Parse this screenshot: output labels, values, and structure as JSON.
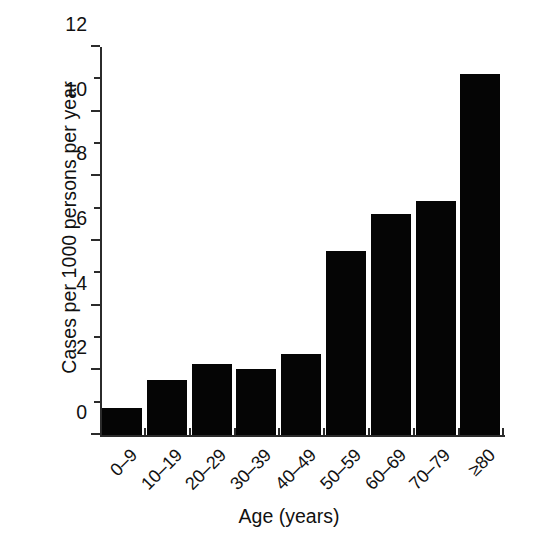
{
  "chart_data": {
    "type": "bar",
    "title": "",
    "xlabel": "Age (years)",
    "ylabel": "Cases per 1000 persons per year",
    "categories": [
      "0–9",
      "10–19",
      "20–29",
      "30–39",
      "40–49",
      "50–59",
      "60–69",
      "70–79",
      "≥80"
    ],
    "values": [
      0.85,
      1.7,
      2.2,
      2.05,
      2.5,
      5.7,
      6.85,
      7.25,
      11.15
    ],
    "ylim": [
      0,
      12
    ],
    "yticks": [
      0,
      2,
      4,
      6,
      8,
      10,
      12
    ],
    "ytick_labels": [
      "0",
      "2",
      "4",
      "6",
      "8",
      "10",
      "12"
    ],
    "yminor_ticks": [
      1,
      3,
      5,
      7,
      9,
      11
    ],
    "grid": false,
    "legend": null,
    "bar_color": "#050505",
    "axis_color": "#2b2b2b",
    "background": "#ffffff"
  }
}
